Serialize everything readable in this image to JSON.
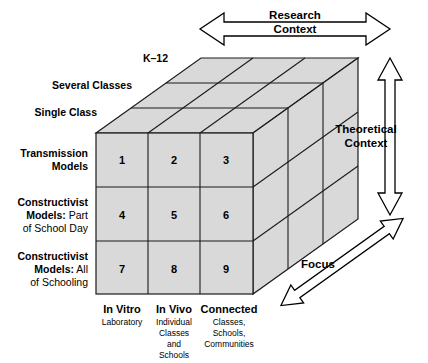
{
  "figure": {
    "fill_color": "#d9d9d9",
    "line_color": "#1a1a1a"
  },
  "axes": {
    "horizontal": {
      "name": "research-context-axis",
      "line1": "Research",
      "line2": "Context",
      "arrow": "double-headed-horizontal"
    },
    "vertical": {
      "name": "theoretical-context-axis",
      "line1": "Theoretical",
      "line2": "Context",
      "arrow": "double-headed-vertical"
    },
    "depth": {
      "name": "focus-axis",
      "label": "Focus",
      "arrow": "double-headed-diagonal"
    }
  },
  "depth_labels": [
    {
      "text": "K–12"
    },
    {
      "text": "Several Classes"
    },
    {
      "text": "Single Class"
    }
  ],
  "row_labels": [
    {
      "bold": "Transmission",
      "bold2": "Models",
      "regular": ""
    },
    {
      "bold": "Constructivist",
      "bold2": "Models:",
      "regular": " Part",
      "regular2": "of School Day"
    },
    {
      "bold": "Constructivist",
      "bold2": "Models:",
      "regular": " All",
      "regular2": "of Schooling"
    }
  ],
  "column_labels": [
    {
      "title": "In Vitro",
      "sub": [
        "Laboratory"
      ]
    },
    {
      "title": "In Vivo",
      "sub": [
        "Individual",
        "Classes",
        "and",
        "Schools"
      ]
    },
    {
      "title": "Connected",
      "sub": [
        "Classes,",
        "Schools,",
        "Communities"
      ]
    }
  ],
  "cells": [
    {
      "id": "1",
      "row": 0,
      "col": 0
    },
    {
      "id": "2",
      "row": 0,
      "col": 1
    },
    {
      "id": "3",
      "row": 0,
      "col": 2
    },
    {
      "id": "4",
      "row": 1,
      "col": 0
    },
    {
      "id": "5",
      "row": 1,
      "col": 1
    },
    {
      "id": "6",
      "row": 1,
      "col": 2
    },
    {
      "id": "7",
      "row": 2,
      "col": 0
    },
    {
      "id": "8",
      "row": 2,
      "col": 1
    },
    {
      "id": "9",
      "row": 2,
      "col": 2
    }
  ]
}
